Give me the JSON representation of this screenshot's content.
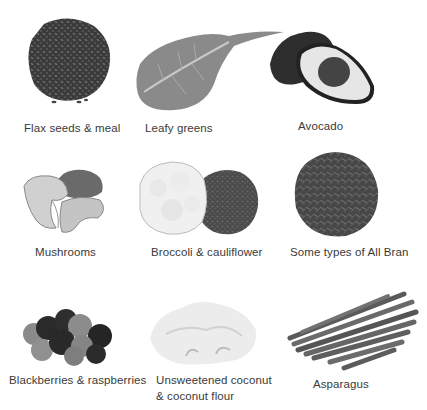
{
  "items": [
    {
      "label": "Flax seeds & meal",
      "icon": "flax-seeds-icon"
    },
    {
      "label": "Leafy greens",
      "icon": "leafy-greens-icon"
    },
    {
      "label": "Avocado",
      "icon": "avocado-icon"
    },
    {
      "label": "Mushrooms",
      "icon": "mushrooms-icon"
    },
    {
      "label": "Broccoli & cauliflower",
      "icon": "broccoli-cauliflower-icon"
    },
    {
      "label": "Some types of All Bran",
      "icon": "all-bran-icon"
    },
    {
      "label": "Blackberries & raspberries",
      "icon": "berries-icon"
    },
    {
      "label": "Unsweetened coconut",
      "label2": "& coconut flour",
      "icon": "coconut-icon"
    },
    {
      "label": "Asparagus",
      "icon": "asparagus-icon"
    }
  ]
}
